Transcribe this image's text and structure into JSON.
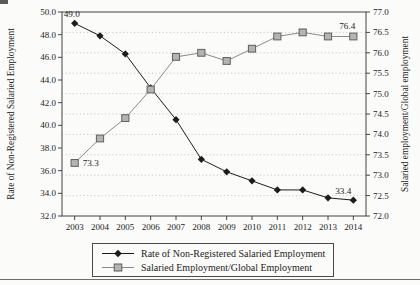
{
  "chart_data": {
    "type": "line",
    "title": "",
    "x_categories": [
      "2003",
      "2004",
      "2005",
      "2006",
      "2007",
      "2008",
      "2009",
      "2010",
      "2011",
      "2012",
      "2013",
      "2014"
    ],
    "series": [
      {
        "name": "Rate of Non-Registered Salaried Employment",
        "axis": "left",
        "marker": "diamond",
        "values": [
          49.0,
          47.9,
          46.3,
          43.3,
          40.5,
          37.0,
          35.9,
          35.1,
          34.3,
          34.3,
          33.6,
          33.4
        ]
      },
      {
        "name": "Salaried Employment/Global Employment",
        "axis": "right",
        "marker": "square",
        "values": [
          73.3,
          73.9,
          74.4,
          75.1,
          75.9,
          76.0,
          75.8,
          76.1,
          76.4,
          76.5,
          76.4,
          76.4
        ]
      }
    ],
    "left_axis": {
      "label": "Rate of Non-Registered Salaried Employment",
      "min": 32,
      "max": 50,
      "step": 2,
      "tick_labels": [
        "50.0",
        "48.0",
        "46.0",
        "44.0",
        "42.0",
        "40.0",
        "38.0",
        "36.0",
        "34.0",
        "32.0"
      ]
    },
    "right_axis": {
      "label": "Salaried employment/Global employment",
      "min": 72,
      "max": 77,
      "step": 0.5,
      "tick_labels": [
        "77.0",
        "76.5",
        "76.0",
        "75.5",
        "75.0",
        "74.5",
        "74.0",
        "73.5",
        "73.0",
        "72.5",
        "72.0"
      ]
    },
    "gridlines": {
      "on_axis": "right",
      "values": [
        72.5,
        73.0,
        73.5,
        74.0,
        74.5,
        75.0,
        75.5,
        76.0,
        76.5
      ],
      "style": "dotted"
    },
    "annotations": [
      {
        "series": 0,
        "index": 0,
        "text": "49.0",
        "dx": -11,
        "dy": -6,
        "anchor": "start"
      },
      {
        "series": 0,
        "index": 11,
        "text": "33.4",
        "dx": -2,
        "dy": -6,
        "anchor": "end"
      },
      {
        "series": 1,
        "index": 0,
        "text": "73.3",
        "dx": 8,
        "dy": 3,
        "anchor": "start"
      },
      {
        "series": 1,
        "index": 11,
        "text": "76.4",
        "dx": 2,
        "dy": -7,
        "anchor": "end"
      }
    ],
    "legend": {
      "position": "bottom",
      "border": true,
      "entries": [
        "Rate of Non-Registered Salaried Employment",
        "Salaried Employment/Global Employment"
      ]
    }
  },
  "colors": {
    "series1": "#1c1c1c",
    "series2_line": "#8a8a8a",
    "series2_fill": "#b4b4b4",
    "series2_edge": "#5f5f5f",
    "grid": "#bcbcbc",
    "frame": "#454545",
    "text": "#1b1b1b",
    "background": "#fbfbf9"
  }
}
